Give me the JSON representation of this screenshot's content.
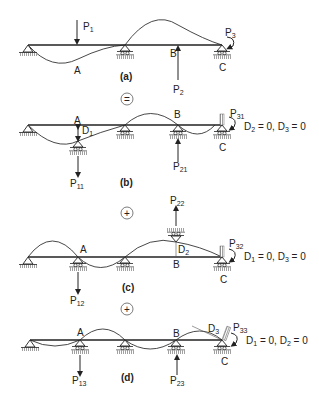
{
  "figure": {
    "panels": [
      {
        "id": "a",
        "caption": "(a)",
        "labels": {
          "A": "A",
          "B": "B",
          "C": "C"
        },
        "loads": [
          {
            "name": "P",
            "sub": "1"
          },
          {
            "name": "P",
            "sub": "2"
          },
          {
            "name": "P",
            "sub": "3"
          }
        ]
      },
      {
        "id": "b",
        "caption": "(b)",
        "labels": {
          "A": "A",
          "B": "B",
          "C": "C",
          "D": "D",
          "Dsub": "1"
        },
        "loads": [
          {
            "name": "P",
            "sub": "11"
          },
          {
            "name": "P",
            "sub": "21"
          },
          {
            "name": "P",
            "sub": "31"
          }
        ],
        "condition": {
          "d1": "D",
          "s1": "2",
          "eq1": " = 0, ",
          "d2": "D",
          "s2": "3",
          "eq2": " = 0"
        }
      },
      {
        "id": "c",
        "caption": "(c)",
        "labels": {
          "A": "A",
          "B": "B",
          "C": "C",
          "D": "D",
          "Dsub": "2"
        },
        "loads": [
          {
            "name": "P",
            "sub": "12"
          },
          {
            "name": "P",
            "sub": "22"
          },
          {
            "name": "P",
            "sub": "32"
          }
        ],
        "condition": {
          "d1": "D",
          "s1": "1",
          "eq1": " = 0, ",
          "d2": "D",
          "s2": "3",
          "eq2": " = 0"
        }
      },
      {
        "id": "d",
        "caption": "(d)",
        "labels": {
          "A": "A",
          "B": "B",
          "C": "C",
          "D": "D",
          "Dsub": "3"
        },
        "loads": [
          {
            "name": "P",
            "sub": "13"
          },
          {
            "name": "P",
            "sub": "23"
          },
          {
            "name": "P",
            "sub": "33"
          }
        ],
        "condition": {
          "d1": "D",
          "s1": "1",
          "eq1": " = 0, ",
          "d2": "D",
          "s2": "2",
          "eq2": " = 0"
        }
      }
    ],
    "operators": [
      "=",
      "+",
      "+"
    ]
  }
}
